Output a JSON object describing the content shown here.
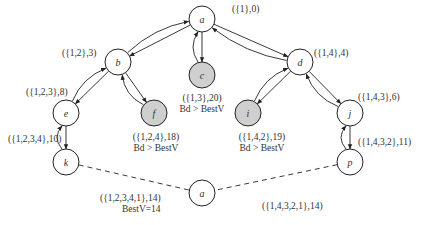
{
  "diagram": {
    "type": "search-tree",
    "nodes": [
      {
        "id": "a_root",
        "label": "a",
        "x": 202,
        "y": 19,
        "pruned": false,
        "annotation": [
          "({1},0)"
        ],
        "ann_x": 232,
        "ann_y": 12
      },
      {
        "id": "b",
        "label": "b",
        "x": 118,
        "y": 62,
        "pruned": false,
        "annotation": [
          "({1,2},3)"
        ],
        "ann_x": 62,
        "ann_y": 56
      },
      {
        "id": "c",
        "label": "c",
        "x": 202,
        "y": 75,
        "pruned": true,
        "annotation": [
          "({1,3},20)",
          "Bd > BestV"
        ],
        "ann_x": 202,
        "ann_y": 101
      },
      {
        "id": "d",
        "label": "d",
        "x": 300,
        "y": 62,
        "pruned": false,
        "annotation": [
          "({1,4},4)"
        ],
        "ann_x": 314,
        "ann_y": 56
      },
      {
        "id": "e",
        "label": "e",
        "x": 66,
        "y": 113,
        "pruned": false,
        "annotation": [
          "({1,2,3},8)"
        ],
        "ann_x": 26,
        "ann_y": 95
      },
      {
        "id": "f",
        "label": "f",
        "x": 154,
        "y": 113,
        "pruned": true,
        "annotation": [
          "({1,2,4},18)",
          "Bd > BestV"
        ],
        "ann_x": 156,
        "ann_y": 140
      },
      {
        "id": "i",
        "label": "i",
        "x": 248,
        "y": 113,
        "pruned": true,
        "annotation": [
          "({1,4,2},19)",
          "Bd > BestV"
        ],
        "ann_x": 262,
        "ann_y": 140
      },
      {
        "id": "j",
        "label": "j",
        "x": 350,
        "y": 113,
        "pruned": false,
        "annotation": [
          "({1,4,3},6)"
        ],
        "ann_x": 358,
        "ann_y": 100
      },
      {
        "id": "k",
        "label": "k",
        "x": 66,
        "y": 162,
        "pruned": false,
        "annotation": [
          "({1,2,3,4},10)"
        ],
        "ann_x": 8,
        "ann_y": 142
      },
      {
        "id": "p",
        "label": "p",
        "x": 350,
        "y": 162,
        "pruned": false,
        "annotation": [
          "({1,4,3,2},11)"
        ],
        "ann_x": 358,
        "ann_y": 145
      },
      {
        "id": "a_leaf",
        "label": "a",
        "x": 202,
        "y": 193,
        "pruned": false,
        "annotation": [],
        "ann_x": 0,
        "ann_y": 0
      }
    ],
    "leaf_annotations": [
      {
        "lines": [
          "({1,2,3,4,1},14)",
          "BestV=14"
        ],
        "x": 100,
        "y": 201
      },
      {
        "lines": [
          "({1,4,3,2,1},14)"
        ],
        "x": 262,
        "y": 209
      }
    ],
    "edges": [
      {
        "from": "a_root",
        "to": "b",
        "style": "tree"
      },
      {
        "from": "a_root",
        "to": "c",
        "style": "tree"
      },
      {
        "from": "a_root",
        "to": "d",
        "style": "tree"
      },
      {
        "from": "b",
        "to": "e",
        "style": "tree"
      },
      {
        "from": "b",
        "to": "f",
        "style": "tree"
      },
      {
        "from": "d",
        "to": "i",
        "style": "tree"
      },
      {
        "from": "d",
        "to": "j",
        "style": "tree"
      },
      {
        "from": "e",
        "to": "k",
        "style": "tree"
      },
      {
        "from": "j",
        "to": "p",
        "style": "tree"
      },
      {
        "from": "k",
        "to": "a_leaf",
        "style": "dashed"
      },
      {
        "from": "p",
        "to": "a_leaf",
        "style": "dashed"
      }
    ],
    "colors": {
      "stroke": "#222222",
      "pruned_fill": "#cfcfcf",
      "node_fill": "#ffffff"
    }
  }
}
